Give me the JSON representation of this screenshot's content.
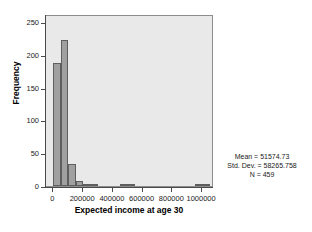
{
  "chart_data": {
    "type": "bar",
    "title": "",
    "subtitle": "",
    "xlabel": "Expected income at age 30",
    "ylabel": "Frequency",
    "xlim": [
      -50000,
      1080000
    ],
    "ylim": [
      0,
      262
    ],
    "grid": false,
    "legend": null,
    "xticks": [
      0,
      200000,
      400000,
      600000,
      800000,
      1000000
    ],
    "xtick_labels": [
      "0",
      "200000",
      "400000",
      "600000",
      "800000",
      "1000000"
    ],
    "yticks": [
      0,
      50,
      100,
      150,
      200,
      250
    ],
    "ytick_labels": [
      "0",
      "50",
      "100",
      "150",
      "200",
      "250"
    ],
    "bin_width": 50000,
    "categories": [
      "0-50000",
      "50000-100000",
      "100000-150000",
      "150000-200000",
      "200000-250000",
      "250000-300000",
      "450000-500000",
      "500000-550000",
      "950000-1000000",
      "1000000-1050000"
    ],
    "bin_starts": [
      0,
      50000,
      100000,
      150000,
      200000,
      250000,
      450000,
      500000,
      950000,
      1000000
    ],
    "values": [
      188,
      222,
      33,
      7,
      3,
      3,
      1,
      1,
      1,
      1
    ],
    "annotations": [
      "Mean = 51574.73",
      "Std. Dev. = 58265.758",
      "N = 459"
    ]
  },
  "stats": {
    "mean_label": "Mean = 51574.73",
    "stddev_label": "Std. Dev. = 58265.758",
    "n_label": "N = 459"
  },
  "colors": {
    "bar_fill": "#a0a0a0",
    "bar_edge": "#5e5e5e",
    "plot_background": "#e9e9e9",
    "figure_background": "#ffffff",
    "axis": "#4a4a4a",
    "text": "#1a1a1a"
  }
}
